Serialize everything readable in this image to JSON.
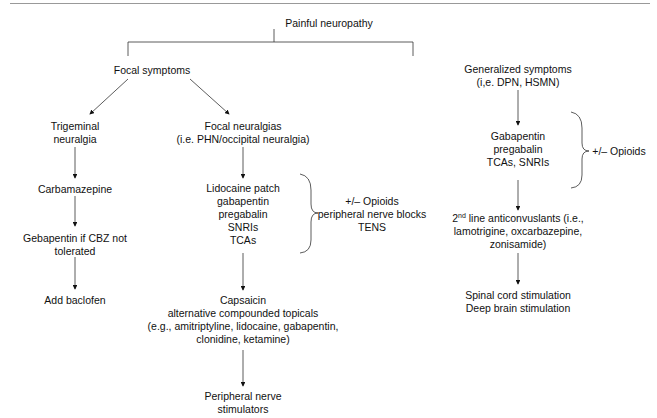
{
  "root": "Painful neuropathy",
  "focal": {
    "title": "Focal symptoms",
    "trigeminal": {
      "title": [
        "Trigeminal",
        "neuralgia"
      ],
      "steps": [
        [
          "Carbamazepine"
        ],
        [
          "Gebapentin if CBZ not",
          "tolerated"
        ],
        [
          "Add baclofen"
        ]
      ]
    },
    "neuralgias": {
      "title": [
        "Focal neuralgias",
        "(i.e. PHN/occipital neuralgia)"
      ],
      "first_line": [
        "Lidocaine patch",
        "gabapentin",
        "pregabalin",
        "SNRIs",
        "TCAs"
      ],
      "adjuncts": [
        "+/– Opioids",
        "peripheral nerve blocks",
        "TENS"
      ],
      "topicals": [
        "Capsaicin",
        "alternative compounded topicals",
        "(e.g., amitriptyline, lidocaine, gabapentin,",
        "clonidine, ketamine)"
      ],
      "final": [
        "Peripheral nerve",
        "stimulators"
      ]
    }
  },
  "generalized": {
    "title": [
      "Generalized symptoms",
      "(i,e. DPN, HSMN)"
    ],
    "first_line": [
      "Gabapentin",
      "pregabalin",
      "TCAs, SNRIs"
    ],
    "adjunct": "+/– Opioids",
    "second_line": {
      "sup_prefix": "2",
      "sup": "nd",
      "line1_rest": " line anticonvuslants (i.e.,",
      "line2": "lamotrigine, oxcarbazepine,",
      "line3": "zonisamide)"
    },
    "final": [
      "Spinal cord stimulation",
      "Deep brain stimulation"
    ]
  }
}
